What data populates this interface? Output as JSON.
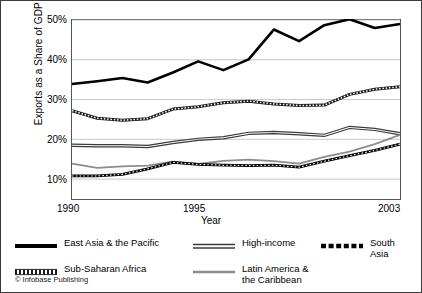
{
  "chart_data": {
    "type": "line",
    "title": "",
    "xlabel": "Year",
    "ylabel": "Exports as a Share of GDP (%)",
    "xlim": [
      1990,
      2003
    ],
    "ylim": [
      5,
      50
    ],
    "grid": true,
    "legend_position": "bottom",
    "x": [
      1990,
      1991,
      1992,
      1993,
      1994,
      1995,
      1996,
      1997,
      1998,
      1999,
      2000,
      2001,
      2002,
      2003
    ],
    "xticks": [
      "1990",
      "1995",
      "2003"
    ],
    "xtick_values": [
      1990,
      1995,
      2003
    ],
    "yticks": [
      "10%",
      "20%",
      "30%",
      "40%",
      "50%"
    ],
    "ytick_values": [
      10,
      20,
      30,
      40,
      50
    ],
    "series": [
      {
        "name": "East Asia & the Pacific",
        "style": "thick-solid",
        "color": "#000000",
        "values": [
          33.9,
          34.6,
          35.4,
          34.3,
          36.8,
          39.6,
          37.4,
          40.1,
          47.6,
          44.7,
          48.7,
          50.2,
          48.0,
          49.0
        ]
      },
      {
        "name": "Sub-Saharan Africa",
        "style": "dotted-outline",
        "color": "#1a1a1a",
        "values": [
          27.2,
          25.3,
          24.8,
          25.2,
          27.6,
          28.2,
          29.2,
          29.6,
          28.9,
          28.5,
          28.6,
          31.3,
          32.6,
          33.2
        ]
      },
      {
        "name": "High-income",
        "style": "double-line",
        "color": "#3b3b3b",
        "values": [
          18.5,
          18.4,
          18.4,
          18.2,
          19.2,
          20.0,
          20.4,
          21.5,
          21.7,
          21.4,
          21.0,
          23.0,
          22.5,
          21.4
        ]
      },
      {
        "name": "Latin America & the Caribbean",
        "style": "gray-solid",
        "color": "#8c8c8c",
        "values": [
          13.9,
          12.8,
          13.2,
          13.4,
          14.4,
          13.8,
          14.6,
          14.9,
          14.5,
          13.9,
          15.6,
          16.9,
          18.8,
          21.1
        ]
      },
      {
        "name": "South Asia",
        "style": "thick-dashed",
        "color": "#000000",
        "values": [
          10.8,
          10.8,
          11.2,
          12.6,
          14.2,
          13.7,
          13.5,
          13.4,
          13.5,
          13.0,
          14.5,
          15.9,
          17.2,
          18.8
        ]
      }
    ]
  },
  "axes": {
    "ylabel": "Exports as a Share of GDP (%)",
    "xlabel": "Year",
    "ytick_labels": [
      "50%",
      "40%",
      "30%",
      "20%",
      "10%"
    ],
    "xtick_labels": [
      "1990",
      "1995",
      "2003"
    ]
  },
  "legend": {
    "items": [
      {
        "label": "East Asia & the Pacific",
        "swatch": "thick-solid-line-icon"
      },
      {
        "label": "High-income",
        "swatch": "double-line-icon"
      },
      {
        "label": "South Asia",
        "swatch": "thick-dashed-line-icon"
      },
      {
        "label": "Sub-Saharan Africa",
        "swatch": "dotted-line-icon"
      },
      {
        "label": "Latin America &\nthe Caribbean",
        "swatch": "gray-line-icon"
      }
    ]
  },
  "footer": {
    "copyright": "© Infobase Publishing"
  }
}
